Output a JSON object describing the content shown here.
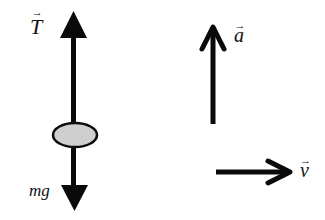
{
  "diagram": {
    "colors": {
      "stroke": "#0a0a0a",
      "body_fill": "#cfcfcf",
      "background": "#ffffff"
    },
    "labels": {
      "tension": {
        "symbol": "T",
        "arrow": "→"
      },
      "weight": {
        "text": "mg"
      },
      "acceleration": {
        "symbol": "a",
        "arrow": "→"
      },
      "velocity": {
        "symbol": "v",
        "arrow": "→"
      }
    },
    "vectors": [
      {
        "name": "tension",
        "direction": "up"
      },
      {
        "name": "weight",
        "direction": "down"
      },
      {
        "name": "acceleration",
        "direction": "up"
      },
      {
        "name": "velocity",
        "direction": "right"
      }
    ]
  }
}
